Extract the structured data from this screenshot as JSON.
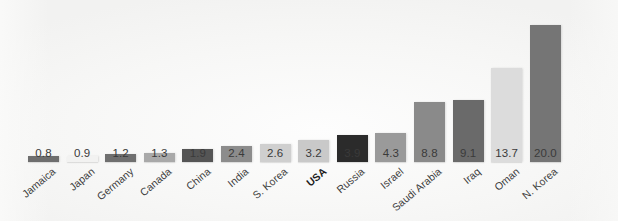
{
  "chart_data": {
    "type": "bar",
    "title": "",
    "subtitle": "",
    "xlabel": "",
    "ylabel": "",
    "ylim": [
      0,
      20.0
    ],
    "grid": false,
    "legend": null,
    "orientation": "vertical",
    "sorted": "ascending",
    "categories": [
      "Jamaica",
      "Japan",
      "Germany",
      "Canada",
      "China",
      "India",
      "S. Korea",
      "USA",
      "Russia",
      "Israel",
      "Saudi Arabia",
      "Iraq",
      "Oman",
      "N. Korea"
    ],
    "values": [
      0.8,
      0.9,
      1.2,
      1.3,
      1.9,
      2.4,
      2.6,
      3.2,
      3.9,
      4.3,
      8.8,
      9.1,
      13.7,
      20.0
    ],
    "value_labels": [
      "0.8",
      "0.9",
      "1.2",
      "1.3",
      "1.9",
      "2.4",
      "2.6",
      "3.2",
      "3.9",
      "4.3",
      "8.8",
      "9.1",
      "13.7",
      "20.0"
    ],
    "bar_colors": [
      "#6e6e6e",
      "#f2f2f1",
      "#6f6f6f",
      "#a9a9a9",
      "#555555",
      "#8c8c8c",
      "#cfcfcf",
      "#c9c9c9",
      "#2b2b2b",
      "#9a9a9a",
      "#8a8a8a",
      "#6a6a6a",
      "#dcdcdc",
      "#757575"
    ],
    "emphasized_categories": [
      "USA"
    ],
    "background_color": "#f7f7f6",
    "label_color": "#3a3a3a",
    "label_rotation_deg": -40
  }
}
